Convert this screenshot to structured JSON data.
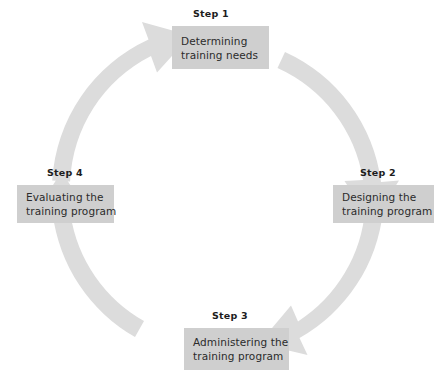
{
  "diagram": {
    "type": "cycle",
    "colors": {
      "box_fill": "#cfcfcf",
      "arrow_fill": "#dcdcdc",
      "box_text": "#2b2b2b",
      "step_label_text": "#1d1d1d",
      "background": "#ffffff"
    },
    "steps": [
      {
        "label": "Step 1",
        "line1": "Determining",
        "line2": "training needs",
        "position": "top"
      },
      {
        "label": "Step 2",
        "line1": "Designing the",
        "line2": "training program",
        "position": "right"
      },
      {
        "label": "Step 3",
        "line1": "Administering the",
        "line2": "training program",
        "position": "bottom"
      },
      {
        "label": "Step 4",
        "line1": "Evaluating the",
        "line2": "training program",
        "position": "left"
      }
    ],
    "arrows": [
      {
        "name": "arrow-step4-to-step1",
        "from": "Step 4",
        "to": "Step 1",
        "direction": "clockwise"
      },
      {
        "name": "arrow-step1-to-step2",
        "from": "Step 1",
        "to": "Step 2",
        "direction": "clockwise"
      },
      {
        "name": "arrow-step2-to-step3",
        "from": "Step 2",
        "to": "Step 3",
        "direction": "clockwise"
      },
      {
        "name": "arrow-step3-to-step4",
        "from": "Step 3",
        "to": "Step 4",
        "direction": "clockwise"
      }
    ]
  }
}
